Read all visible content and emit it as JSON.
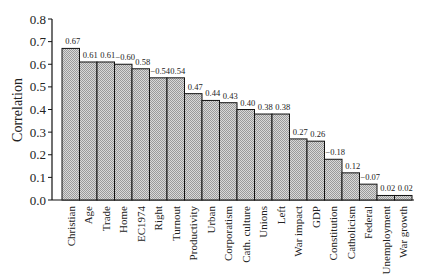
{
  "chart_data": {
    "type": "bar",
    "title": "",
    "xlabel": "",
    "ylabel": "Correlation",
    "ylim": [
      0.0,
      0.8
    ],
    "yticks": [
      "0.0",
      "0.1",
      "0.2",
      "0.3",
      "0.4",
      "0.5",
      "0.6",
      "0.7",
      "0.8"
    ],
    "grid": false,
    "legend": null,
    "categories": [
      "Christian",
      "Age",
      "Trade",
      "Home",
      "EC1974",
      "Right",
      "Turnout",
      "Productivity",
      "Urban",
      "Corporatism",
      "Cath. culture",
      "Unions",
      "Left",
      "War impact",
      "GDP",
      "Constitution",
      "Catholicism",
      "Federal",
      "Unemployment",
      "War growth"
    ],
    "values": [
      0.67,
      0.61,
      0.61,
      0.6,
      0.58,
      0.54,
      0.54,
      0.47,
      0.44,
      0.43,
      0.4,
      0.38,
      0.38,
      0.27,
      0.26,
      0.18,
      0.12,
      0.07,
      0.02,
      0.02
    ],
    "bar_labels": [
      "0.67",
      "0.61",
      "0.61",
      "−0.60",
      "0.58",
      "−0.54",
      "0.54",
      "0.47",
      "0.44",
      "0.43",
      "0.40",
      "0.38",
      "0.38",
      "0.27",
      "0.26",
      "−0.18",
      "0.12",
      "−0.07",
      "0.02",
      "0.02"
    ],
    "bar_color": "#c8c8c8",
    "bar_edge_color": "#111111"
  }
}
